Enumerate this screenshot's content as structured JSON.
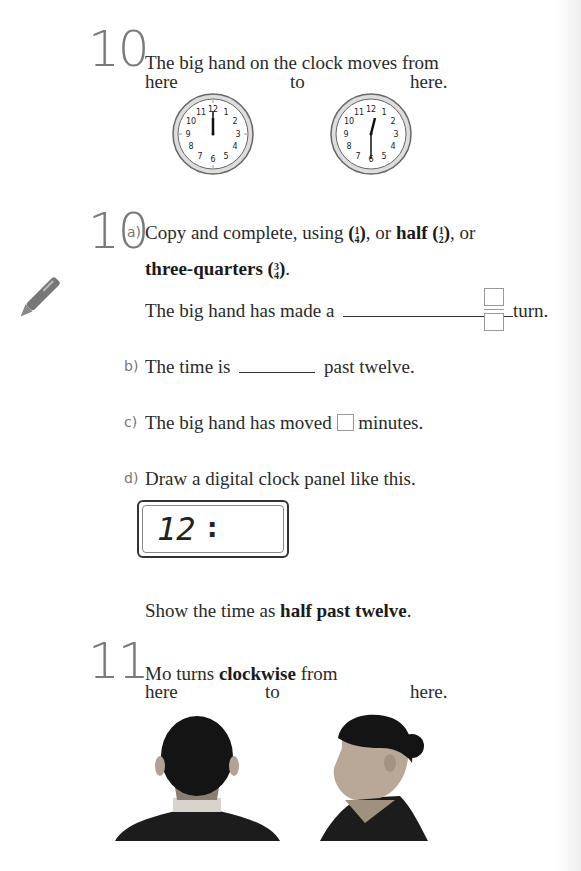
{
  "q10_intro": {
    "number": "10",
    "line1": "The big hand on the clock moves from",
    "label_from": "here",
    "label_to": "to",
    "label_here2": "here.",
    "clock_from": {
      "hour_hand": "12",
      "minute_hand": "12",
      "numbers": [
        "12",
        "1",
        "2",
        "3",
        "4",
        "5",
        "6",
        "7",
        "8",
        "9",
        "10",
        "11"
      ]
    },
    "clock_to": {
      "hour_hand": "12-1",
      "minute_hand": "6"
    }
  },
  "q10_parts": {
    "number": "10",
    "a": {
      "label": "a)",
      "text_pre": "Copy and complete, using",
      "quarter_num": "1",
      "quarter_den": "4",
      "text_or": ", or",
      "half_word": "half",
      "half_num": "1",
      "half_den": "2",
      "text_or2": ", or",
      "three_quarters_word": "three-quarters",
      "tq_num": "3",
      "tq_den": "4",
      "text_end": ".",
      "sentence_pre": "The big hand has made a",
      "sentence_post": "turn."
    },
    "b": {
      "label": "b)",
      "text_pre": "The time is",
      "text_post": "past twelve."
    },
    "c": {
      "label": "c)",
      "text_pre": "The big hand has moved",
      "text_post": "minutes."
    },
    "d": {
      "label": "d)",
      "text": "Draw a digital clock panel like this.",
      "lcd_digits": "12",
      "lcd_colon": ":",
      "show_pre": "Show the time as",
      "show_bold": "half past twelve",
      "show_end": "."
    }
  },
  "q11": {
    "number": "11",
    "line1_pre": "Mo turns",
    "line1_bold": "clockwise",
    "line1_post": "from",
    "label_from": "here",
    "label_to": "to",
    "label_here2": "here.",
    "photo_left": "back-of-head",
    "photo_right": "side-profile"
  },
  "icons": {
    "pencil": "pencil-icon"
  }
}
